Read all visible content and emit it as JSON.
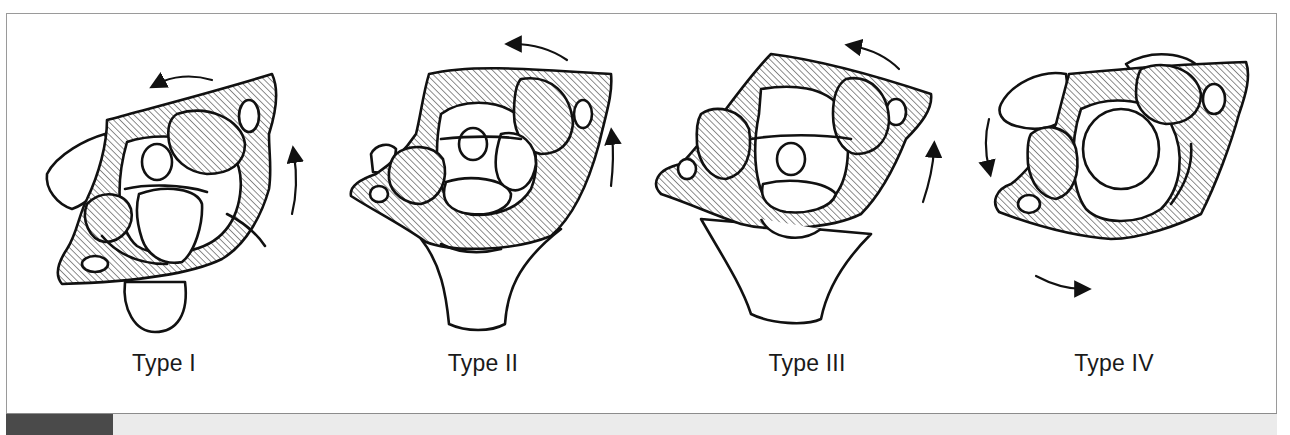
{
  "figure": {
    "panels": [
      {
        "id": "type-1",
        "label": "Type I",
        "rotation_arrows": "counterclockwise (top: leftward, right: upward)"
      },
      {
        "id": "type-2",
        "label": "Type II",
        "rotation_arrows": "counterclockwise (top: leftward, right: upward)"
      },
      {
        "id": "type-3",
        "label": "Type III",
        "rotation_arrows": "counterclockwise (top: leftward, right: upward)"
      },
      {
        "id": "type-4",
        "label": "Type IV",
        "rotation_arrows": "counterclockwise (left: downward, bottom: rightward)"
      }
    ],
    "colors": {
      "line": "#111111",
      "hatch": "#333333",
      "frame": "#9a9a9a",
      "bottom_bar": "#ebebeb",
      "bottom_block": "#4a4a4a"
    }
  }
}
